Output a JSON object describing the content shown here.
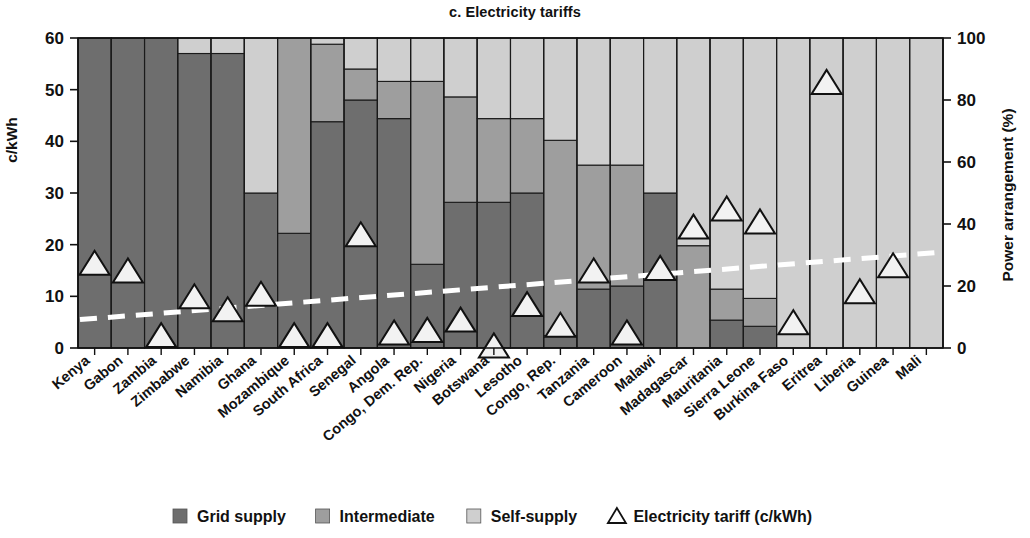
{
  "chart_data": {
    "type": "bar",
    "title": "c. Electricity tariffs",
    "subtitle": "",
    "xlabel": "",
    "ylabel": "c/kWh",
    "y2label": "Power arrangement (%)",
    "ylim": [
      0,
      60
    ],
    "y2lim": [
      0,
      100
    ],
    "yticks": [
      0,
      10,
      20,
      30,
      40,
      50,
      60
    ],
    "y2ticks": [
      0,
      20,
      40,
      60,
      80,
      100
    ],
    "grid": false,
    "legend_position": "bottom",
    "stacked": true,
    "categories": [
      "Kenya",
      "Gabon",
      "Zambia",
      "Zimbabwe",
      "Namibia",
      "Ghana",
      "Mozambique",
      "South Africa",
      "Senegal",
      "Angola",
      "Congo, Dem. Rep.",
      "Nigeria",
      "Botswana",
      "Lesotho",
      "Congo, Rep.",
      "Tanzania",
      "Cameroon",
      "Malawi",
      "Madagascar",
      "Mauritania",
      "Sierra Leone",
      "Burkina Faso",
      "Eritrea",
      "Liberia",
      "Guinea",
      "Mali"
    ],
    "series": [
      {
        "name": "Grid supply",
        "color": "#6e6e6e",
        "unit": "%",
        "values": [
          100,
          100,
          100,
          95,
          95,
          50,
          37,
          73,
          80,
          74,
          27,
          47,
          47,
          50,
          4,
          19,
          20,
          50,
          0,
          9,
          7,
          0,
          0,
          0,
          0,
          0
        ]
      },
      {
        "name": "Intermediate",
        "color": "#9e9e9e",
        "unit": "%",
        "values": [
          0,
          0,
          0,
          0,
          0,
          0,
          63,
          25,
          10,
          12,
          59,
          34,
          27,
          24,
          63,
          40,
          39,
          0,
          33,
          10,
          9,
          0,
          0,
          0,
          0,
          0
        ]
      },
      {
        "name": "Self-supply",
        "color": "#cfcfcf",
        "unit": "%",
        "values": [
          0,
          0,
          0,
          5,
          5,
          50,
          0,
          2,
          10,
          14,
          14,
          19,
          26,
          26,
          33,
          41,
          41,
          50,
          67,
          81,
          84,
          100,
          100,
          100,
          100,
          100
        ]
      }
    ],
    "marker_series": {
      "name": "Electricity tariff (c/kWh)",
      "marker": "triangle",
      "unit": "c/kWh",
      "values": [
        16.5,
        15.0,
        2.5,
        10.0,
        7.5,
        10.5,
        2.5,
        2.5,
        22.0,
        3.0,
        3.5,
        5.5,
        0.5,
        8.5,
        4.5,
        15.0,
        3.0,
        15.5,
        23.5,
        27.0,
        24.5,
        5.0,
        51.5,
        11.0,
        16.0,
        null
      ]
    },
    "trend_line": {
      "name": "trend",
      "style": "dashed",
      "color": "#ffffff",
      "start_value": 5.5,
      "end_value": 18.5
    },
    "legend": [
      {
        "label": "Grid supply",
        "color": "#6e6e6e",
        "marker": "square"
      },
      {
        "label": "Intermediate",
        "color": "#9e9e9e",
        "marker": "square"
      },
      {
        "label": "Self-supply",
        "color": "#cfcfcf",
        "marker": "square"
      },
      {
        "label": "Electricity tariff (c/kWh)",
        "color": "#ffffff",
        "marker": "triangle"
      }
    ]
  },
  "axes": {
    "left_title": "c/kWh",
    "right_title": "Power arrangement (%)"
  },
  "title": "c. Electricity tariffs"
}
